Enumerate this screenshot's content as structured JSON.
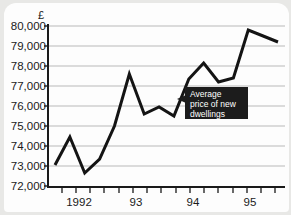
{
  "panel": {
    "background_color": "#e8e8e6",
    "card_color": "#fdfdfd"
  },
  "chart_data": {
    "type": "line",
    "title": "",
    "subtitle": "",
    "xlabel": "",
    "ylabel": "£",
    "ylim": [
      72000,
      80000
    ],
    "ytick_step": 1000,
    "grid": true,
    "legend_position": "none",
    "line_color": "#141414",
    "ytick_labels": [
      "80,000",
      "79,000",
      "78,000",
      "77,000",
      "76,000",
      "75,000",
      "74,000",
      "73,000",
      "72,000"
    ],
    "ytick_values": [
      80000,
      79000,
      78000,
      77000,
      76000,
      75000,
      74000,
      73000,
      72000
    ],
    "xtick_labels": [
      "1992",
      "93",
      "94",
      "95"
    ],
    "xtick_label_values": [
      1992,
      1993,
      1994,
      1995
    ],
    "x_minor_tick_count": 17,
    "series": [
      {
        "name": "Average price of new dwellings",
        "x": [
          1991.75,
          1992.0,
          1992.25,
          1992.5,
          1992.75,
          1993.0,
          1993.25,
          1993.5,
          1993.75,
          1994.0,
          1994.25,
          1994.5,
          1994.75,
          1995.0,
          1995.25,
          1995.5
        ],
        "values": [
          73050,
          74450,
          72650,
          73350,
          75000,
          77600,
          75600,
          75950,
          75500,
          77350,
          78150,
          77200,
          77400,
          79800,
          79500,
          79200
        ]
      }
    ],
    "annotations": [
      {
        "name": "series-callout",
        "text_lines": [
          "Average",
          "price of new",
          "dwellings"
        ],
        "background_color": "#1c1c1c",
        "text_color": "#ffffff",
        "pointer_direction": "left"
      }
    ]
  }
}
